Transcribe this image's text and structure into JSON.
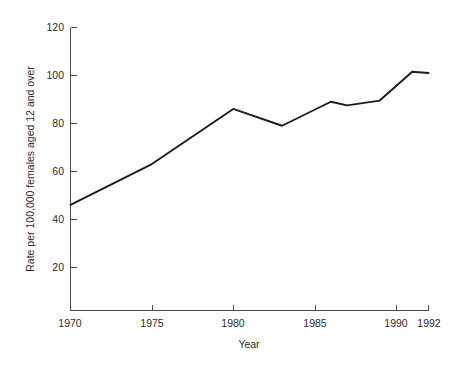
{
  "chart_data": {
    "type": "line",
    "title": "",
    "xlabel": "Year",
    "ylabel": "Rate per 100,000 females aged 12 and over",
    "x": [
      1970,
      1975,
      1980,
      1983,
      1986,
      1987,
      1989,
      1991,
      1992
    ],
    "values": [
      46,
      63,
      86,
      79,
      89,
      87.5,
      89.5,
      101.5,
      101
    ],
    "xlim": [
      1970,
      1992
    ],
    "ylim": [
      0,
      120
    ],
    "xticks": [
      1970,
      1975,
      1980,
      1985,
      1990,
      1992
    ],
    "xtick_labels": [
      "1970",
      "1975",
      "1980",
      "1985",
      "1990",
      "1992"
    ],
    "yticks": [
      20,
      40,
      60,
      80,
      100,
      120
    ],
    "ytick_labels": [
      "20",
      "40",
      "60",
      "80",
      "100",
      "120"
    ],
    "grid": false,
    "legend": null,
    "series": [
      {
        "name": "Rate",
        "x": [
          1970,
          1975,
          1980,
          1983,
          1986,
          1987,
          1989,
          1991,
          1992
        ],
        "values": [
          46,
          63,
          86,
          79,
          89,
          87.5,
          89.5,
          101.5,
          101
        ],
        "color": "#1c1c1c"
      }
    ],
    "annotations": []
  },
  "axes": {
    "y_title": "Rate per 100,000 females aged 12 and over",
    "x_title": "Year",
    "y_tick_0": "20",
    "y_tick_1": "40",
    "y_tick_2": "60",
    "y_tick_3": "80",
    "y_tick_4": "100",
    "y_tick_5": "120",
    "x_tick_0": "1970",
    "x_tick_1": "1975",
    "x_tick_2": "1980",
    "x_tick_3": "1985",
    "x_tick_4": "1990",
    "x_tick_5": "1992"
  },
  "colors": {
    "line": "#1c1c1c",
    "axis": "#4a4a4a",
    "text": "#2b2b2b",
    "background": "#ffffff"
  }
}
